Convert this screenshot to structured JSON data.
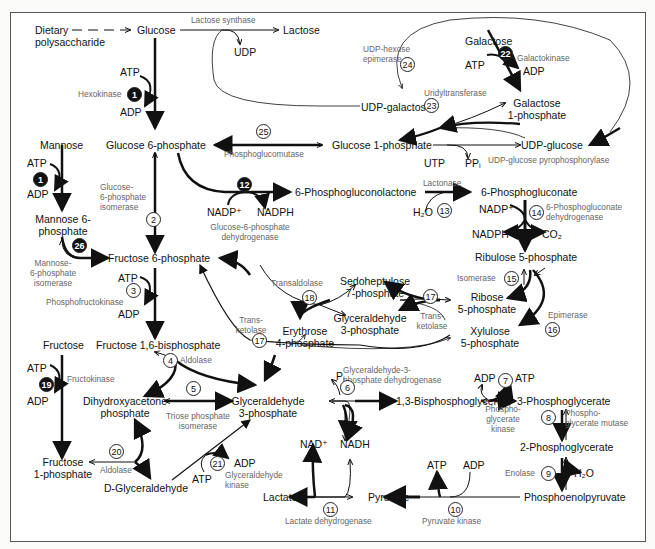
{
  "diagram": {
    "metabolites": {
      "dietary": "Dietary\npolysaccharide",
      "glucose": "Glucose",
      "lactose": "Lactose",
      "udp_top": "UDP",
      "atp1": "ATP",
      "adp1": "ADP",
      "g6p": "Glucose 6-phosphate",
      "g1p": "Glucose 1-phosphate",
      "udp_glucose": "UDP-glucose",
      "udp_galactose": "UDP-galactose",
      "galactose": "Galactose",
      "atp22": "ATP",
      "adp22": "ADP",
      "gal1p": "Galactose\n1-phosphate",
      "utp": "UTP",
      "ppi": "PPᵢ",
      "mannose": "Mannose",
      "atp_m": "ATP",
      "adp_m": "ADP",
      "m6p": "Mannose 6-\nphosphate",
      "pgl": "6-Phosphogluconolactone",
      "nadp12": "NADP⁺",
      "nadph12": "NADPH",
      "pg": "6-Phosphogluconate",
      "h2o13": "H₂O",
      "nadp14": "NADP⁺",
      "nadph14": "NADPH",
      "co2": "CO₂",
      "ru5p": "Ribulose 5-phosphate",
      "r5p": "Ribose\n5-phosphate",
      "x5p": "Xylulose\n5-phosphate",
      "s7p": "Sedoheptulose\n7-phosphate",
      "g3p_ppp": "Glyceraldehyde\n3-phosphate",
      "e4p": "Erythrose\n4-phosphate",
      "f6p": "Fructose 6-phosphate",
      "atp3": "ATP",
      "adp3": "ADP",
      "f16bp": "Fructose 1,6-bisphosphate",
      "fructose": "Fructose",
      "atp19": "ATP",
      "adp19": "ADP",
      "f1p": "Fructose\n1-phosphate",
      "dhap": "Dihydroxyacetone\nphosphate",
      "g3p": "Glyceraldehyde\n3-phosphate",
      "dglyc": "D-Glyceraldehyde",
      "atp21": "ATP",
      "adp21": "ADP",
      "pi": "Pᵢ",
      "bpg": "1,3-Bisphosphoglycerate",
      "nad": "NAD⁺",
      "nadh": "NADH",
      "adp7": "ADP",
      "atp7": "ATP",
      "pg3": "3-Phosphoglycerate",
      "pg2": "2-Phosphoglycerate",
      "h2o9": "H₂O",
      "pep": "Phosphoenolpyruvate",
      "atp10": "ATP",
      "adp10": "ADP",
      "pyruvate": "Pyruvate",
      "lactate": "Lactate"
    },
    "enzymes": {
      "lactose_synthase": "Lactose synthase",
      "hexokinase": "Hexokinase",
      "udp_hexose_epimerase": "UDP-hexose\nepimerase",
      "galactokinase": "Galactokinase",
      "uridyltransferase": "Uridyltransferase",
      "phosphoglucomutase": "Phosphoglucomutase",
      "udpg_ppase": "UDP-glucose pyrophosphorylase",
      "g6p_isomerase": "Glucose-\n6-phosphate\nisomerase",
      "g6pdh": "Glucose-6-phosphate\ndehydrogenase",
      "lactonase": "Lactonase",
      "pgdh": "6-Phosphogluconate\ndehydrogenase",
      "m6p_isomerase": "Mannose-\n6-phosphate\nisomerase",
      "pfk": "Phosphofructokinase",
      "transaldolase": "Transaldolase",
      "isomerase": "Isomerase",
      "transketolase_a": "Trans-\nketolase",
      "transketolase_b": "Trans-\nketolase",
      "epimerase": "Epimerase",
      "aldolase4": "Aldolase",
      "fructokinase": "Fructokinase",
      "tpi": "Triose phosphate\nisomerase",
      "aldolase20": "Aldolase",
      "glyceraldehyde_kinase": "Glyceraldehyde\nkinase",
      "gapdh": "Glyceraldehyde-3-\nphosphate dehydrogenase",
      "pgk": "Phospho-\nglycerate\nkinase",
      "pgm": "Phospho-\nglycerate mutase",
      "enolase": "Enolase",
      "pk": "Pyruvate kinase",
      "ldh": "Lactate dehydrogenase"
    },
    "steps": {
      "s1a": "1",
      "s1b": "1",
      "s2": "2",
      "s3": "3",
      "s4": "4",
      "s5": "5",
      "s6": "6",
      "s7": "7",
      "s8": "8",
      "s9": "9",
      "s10": "10",
      "s11": "11",
      "s12": "12",
      "s13": "13",
      "s14": "14",
      "s15": "15",
      "s16": "16",
      "s17a": "17",
      "s17b": "17",
      "s18": "18",
      "s19": "19",
      "s20": "20",
      "s21": "21",
      "s22": "22",
      "s23": "23",
      "s24": "24",
      "s25": "25",
      "s26": "26"
    },
    "colors": {
      "text": "#111111",
      "enzyme_text": "#666666",
      "arrow": "#111111",
      "frame": "#555555"
    }
  }
}
